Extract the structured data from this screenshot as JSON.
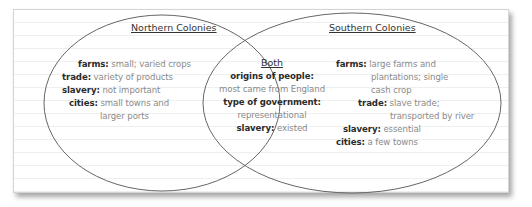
{
  "diagram": {
    "type": "venn",
    "colors": {
      "outline": "#555555",
      "label": "#2b2b2b",
      "value": "#8a8a8a",
      "ruled_line": "#eef0f0"
    },
    "left": {
      "title": "Northern Colonies",
      "items": [
        {
          "key": "farms:",
          "value": "small; varied crops"
        },
        {
          "key": "trade:",
          "value": "variety of products"
        },
        {
          "key": "slavery:",
          "value": "not important"
        },
        {
          "key": "cities:",
          "value": "small towns and",
          "value_cont": "larger ports"
        }
      ]
    },
    "both": {
      "title": "Both",
      "items": [
        {
          "key": "origins of people:",
          "value": "most came from England"
        },
        {
          "key": "type of government:",
          "value": "representational"
        },
        {
          "key": "slavery:",
          "value": "existed"
        }
      ]
    },
    "right": {
      "title": "Southern Colonies",
      "items": [
        {
          "key": "farms:",
          "value": "large farms and",
          "value_cont": [
            "plantations; single",
            "cash crop"
          ]
        },
        {
          "key": "trade:",
          "value": "slave trade;",
          "value_cont": "transported by river"
        },
        {
          "key": "slavery:",
          "value": "essential"
        },
        {
          "key": "cities:",
          "value": "a few towns"
        }
      ]
    }
  }
}
